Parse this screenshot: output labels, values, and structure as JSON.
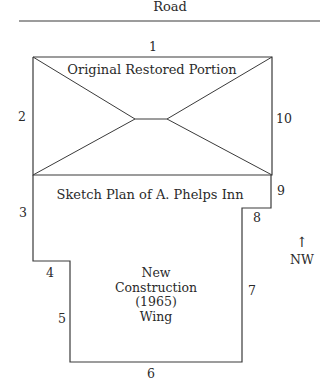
{
  "diagram": {
    "road_label": "Road",
    "sections": {
      "original": "Original Restored Portion",
      "plan_title": "Sketch Plan of A. Phelps Inn",
      "new_wing": [
        "New",
        "Construction",
        "(1965)",
        "Wing"
      ]
    },
    "wall_labels": {
      "w1": "1",
      "w2": "2",
      "w3": "3",
      "w4": "4",
      "w5": "5",
      "w6": "6",
      "w7": "7",
      "w8": "8",
      "w9": "9",
      "w10": "10"
    },
    "compass": {
      "arrow": "↑",
      "direction": "NW"
    },
    "colors": {
      "line": "#3a3a3a",
      "text": "#2a2a2a",
      "background": "#ffffff"
    }
  }
}
